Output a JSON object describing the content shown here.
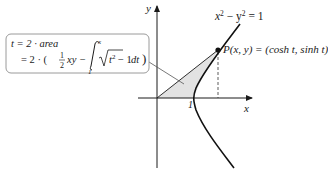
{
  "diagram": {
    "axes": {
      "x_label": "x",
      "y_label": "y",
      "tick_label": "1"
    },
    "curve_label": {
      "base": "x",
      "exp1": "2",
      "minus": " − y",
      "exp2": "2",
      "rhs": " = 1"
    },
    "point_label": "P(x, y) = (cosh t, sinh t)",
    "formula": {
      "line1": "t = 2 · area",
      "line2_prefix": "= 2 · (",
      "half_num": "1",
      "half_den": "2",
      "xy": "xy −",
      "int_upper": "x",
      "int_lower": "1",
      "integrand": "t",
      "integrand_exp": "2",
      "integrand_rest": " − 1",
      "dt": "dt",
      "close": ")"
    },
    "colors": {
      "shade": "#e4e4e4",
      "box_border": "#9a9a9a",
      "curve": "#111111"
    }
  }
}
